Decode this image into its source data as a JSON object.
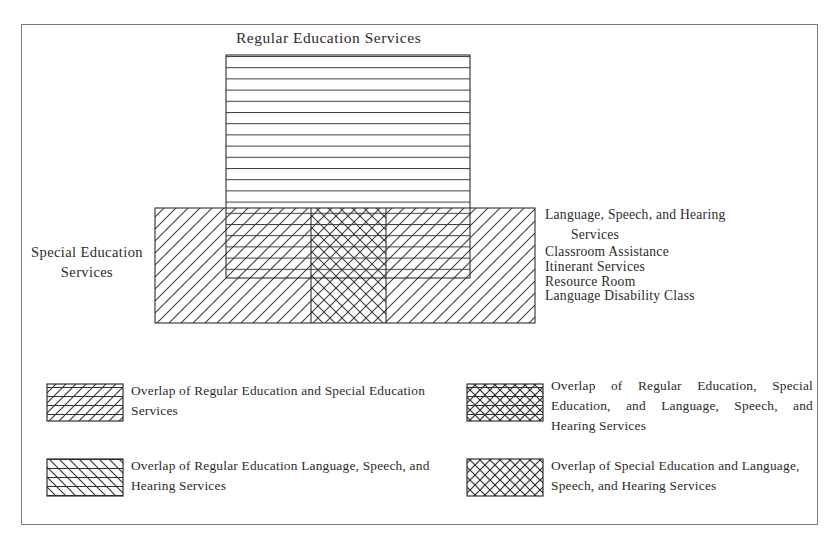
{
  "figure": {
    "type": "venn-style-overlap-diagram",
    "title_regular": "Regular Education Services",
    "label_special": "Special Education\nServices"
  },
  "blocks": {
    "regular": {
      "name": "Regular Education Services",
      "pattern": "horizontal-lines",
      "x": 226,
      "y": 55,
      "w": 244,
      "h": 223
    },
    "special": {
      "name": "Special Education Services",
      "pattern": "diagonal-backslash",
      "x": 155,
      "y": 208,
      "w": 380,
      "h": 115
    },
    "language_speech_hearing": {
      "name": "Language, Speech, and Hearing Services",
      "pattern": "diagonal-forward",
      "x": 311,
      "y": 208,
      "w": 75,
      "h": 115
    }
  },
  "services_list": {
    "items": [
      {
        "text": "Language, Speech, and Hearing",
        "continuation": "Services"
      },
      {
        "text": "Classroom Assistance"
      },
      {
        "text": "Itinerant Services"
      },
      {
        "text": "Resource Room"
      },
      {
        "text": "Language Disability Class"
      }
    ]
  },
  "legend": {
    "items": [
      {
        "key": "overlap-regular-special",
        "pattern": "horizontal-plus-backslash",
        "label": "Overlap of Regular Education and Special Education Services"
      },
      {
        "key": "overlap-regular-special-lsh",
        "pattern": "horizontal-plus-cross-dense",
        "label": "Overlap of Regular Education, Special Education, and Language, Speech, and Hearing Services"
      },
      {
        "key": "overlap-regular-lsh",
        "pattern": "horizontal-plus-forward",
        "label": "Overlap of Regular Education Language, Speech, and Hearing Services"
      },
      {
        "key": "overlap-special-lsh",
        "pattern": "cross-hatch",
        "label": "Overlap of Special Education and Language, Speech, and Hearing Services"
      }
    ]
  },
  "colors": {
    "ink": "#2b2b2b",
    "hatch": "#3a3a3a",
    "frame": "#7d7d7d",
    "background": "#ffffff"
  }
}
